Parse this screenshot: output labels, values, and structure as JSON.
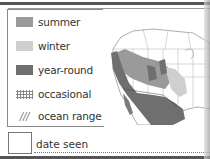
{
  "legend": {
    "items": [
      {
        "label": "summer",
        "swatch": "summer",
        "color": "#9a9a9a"
      },
      {
        "label": "winter",
        "swatch": "winter",
        "color": "#cfcfcf"
      },
      {
        "label": "year-round",
        "swatch": "year-round",
        "color": "#6f6f6f"
      },
      {
        "label": "occasional",
        "swatch": "dotted"
      },
      {
        "label": "ocean range",
        "swatch": "hatched",
        "glyph": "///"
      }
    ]
  },
  "date_seen": {
    "label": "date seen"
  }
}
